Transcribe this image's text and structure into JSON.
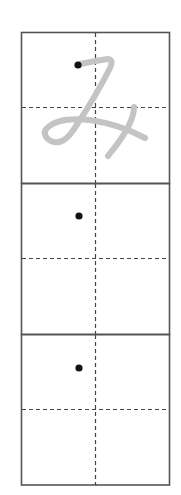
{
  "worksheet": {
    "character": "み",
    "model_stroke_color": "#c4c4c4",
    "grid_line_color": "#555555",
    "guide_line_color": "#444444",
    "start_dot_color": "#111111",
    "boxes": [
      {
        "index": 1,
        "has_model_character": true,
        "start_dot": {
          "x": 78,
          "y": 65
        }
      },
      {
        "index": 2,
        "has_model_character": false,
        "start_dot": {
          "x": 79,
          "y": 216
        }
      },
      {
        "index": 3,
        "has_model_character": false,
        "start_dot": {
          "x": 79,
          "y": 368
        }
      }
    ]
  }
}
